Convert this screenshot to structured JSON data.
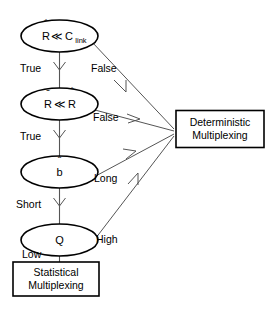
{
  "diagram": {
    "colors": {
      "background": "#ffffff",
      "node_stroke": "#000000",
      "edge_stroke": "#555555",
      "text": "#000000"
    },
    "decisions": [
      {
        "id": "decision-rhat-clink",
        "shape": "ellipse",
        "label_main": "R",
        "label_accent": "hat",
        "label_operator": "≪",
        "label_operand": "C",
        "label_operand_sub": "link",
        "label_text": "R̂ ≪ C_link"
      },
      {
        "id": "decision-rbar-rhat",
        "shape": "ellipse",
        "label_main": "R",
        "label_accent": "bar",
        "label_operator": "≪",
        "label_operand": "R",
        "label_operand_accent": "hat",
        "label_text": "R̄ ≪ R̂"
      },
      {
        "id": "decision-b",
        "shape": "ellipse",
        "label_main": "b",
        "label_accent": "hat",
        "label_text": "b̂"
      },
      {
        "id": "decision-q",
        "shape": "ellipse",
        "label_main": "Q",
        "label_text": "Q"
      }
    ],
    "terminals": [
      {
        "id": "terminal-deterministic",
        "shape": "rectangle",
        "line1": "Deterministic",
        "line2": "Multiplexing"
      },
      {
        "id": "terminal-statistical",
        "shape": "rectangle",
        "line1": "Statistical",
        "line2": "Multiplexing"
      }
    ],
    "edges": [
      {
        "id": "edge-rhat-true",
        "label": "True",
        "from": "decision-rhat-clink",
        "to": "decision-rbar-rhat"
      },
      {
        "id": "edge-rhat-false",
        "label": "False",
        "from": "decision-rhat-clink",
        "to": "terminal-deterministic"
      },
      {
        "id": "edge-rbar-true",
        "label": "True",
        "from": "decision-rbar-rhat",
        "to": "decision-b"
      },
      {
        "id": "edge-rbar-false",
        "label": "False",
        "from": "decision-rbar-rhat",
        "to": "terminal-deterministic"
      },
      {
        "id": "edge-b-short",
        "label": "Short",
        "from": "decision-b",
        "to": "decision-q"
      },
      {
        "id": "edge-b-long",
        "label": "Long",
        "from": "decision-b",
        "to": "terminal-deterministic"
      },
      {
        "id": "edge-q-low",
        "label": "Low",
        "from": "decision-q",
        "to": "terminal-statistical"
      },
      {
        "id": "edge-q-high",
        "label": "High",
        "from": "decision-q",
        "to": "terminal-deterministic"
      }
    ]
  }
}
